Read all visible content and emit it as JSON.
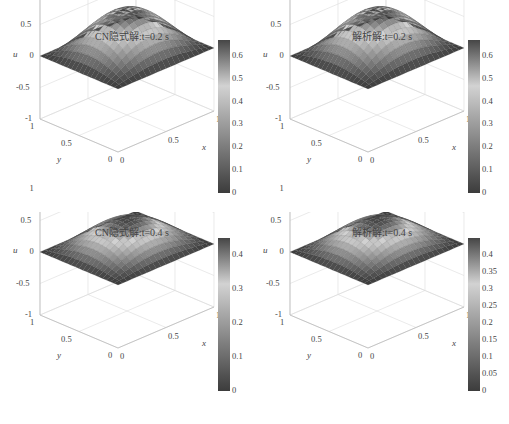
{
  "chart_data": [
    {
      "type": "surface",
      "title": "CN隐式解:t=0.2 s",
      "xlabel": "x",
      "ylabel": "y",
      "zlabel": "u",
      "xticks": [
        "0",
        "0.5",
        "1"
      ],
      "yticks": [
        "0",
        "0.5",
        "1"
      ],
      "zticks": [
        "-1",
        "-0.5",
        "0",
        "0.5",
        "1"
      ],
      "zlim": [
        -1,
        1
      ],
      "peak": 0.67,
      "colorbar": {
        "ticks": [
          "0",
          "0.1",
          "0.2",
          "0.3",
          "0.4",
          "0.5",
          "0.6"
        ],
        "range": [
          0,
          0.67
        ]
      },
      "grid": true
    },
    {
      "type": "surface",
      "title": "解析解:t=0.2 s",
      "xlabel": "x",
      "ylabel": "y",
      "zlabel": "u",
      "xticks": [
        "0",
        "0.5",
        "1"
      ],
      "yticks": [
        "0",
        "0.5",
        "1"
      ],
      "zticks": [
        "-1",
        "-0.5",
        "0",
        "0.5",
        "1"
      ],
      "zlim": [
        -1,
        1
      ],
      "peak": 0.67,
      "colorbar": {
        "ticks": [
          "0",
          "0.1",
          "0.2",
          "0.3",
          "0.4",
          "0.5",
          "0.6"
        ],
        "range": [
          0,
          0.67
        ]
      },
      "grid": true
    },
    {
      "type": "surface",
      "title": "CN隐式解:t=0.4 s",
      "xlabel": "x",
      "ylabel": "y",
      "zlabel": "u",
      "xticks": [
        "0",
        "0.5",
        "1"
      ],
      "yticks": [
        "0",
        "0.5",
        "1"
      ],
      "zticks": [
        "-1",
        "-0.5",
        "0",
        "0.5",
        "1"
      ],
      "zlim": [
        -1,
        1
      ],
      "peak": 0.45,
      "colorbar": {
        "ticks": [
          "0",
          "0.1",
          "0.2",
          "0.3",
          "0.4"
        ],
        "range": [
          0,
          0.45
        ]
      },
      "grid": true
    },
    {
      "type": "surface",
      "title": "解析解:t=0.4 s",
      "xlabel": "x",
      "ylabel": "y",
      "zlabel": "u",
      "xticks": [
        "0",
        "0.5",
        "1"
      ],
      "yticks": [
        "0",
        "0.5",
        "1"
      ],
      "zticks": [
        "-1",
        "-0.5",
        "0",
        "0.5",
        "1"
      ],
      "zlim": [
        -1,
        1
      ],
      "peak": 0.45,
      "colorbar": {
        "ticks": [
          "0",
          "0.05",
          "0.1",
          "0.15",
          "0.2",
          "0.25",
          "0.3",
          "0.35",
          "0.4"
        ],
        "range": [
          0,
          0.45
        ]
      },
      "grid": true
    }
  ]
}
